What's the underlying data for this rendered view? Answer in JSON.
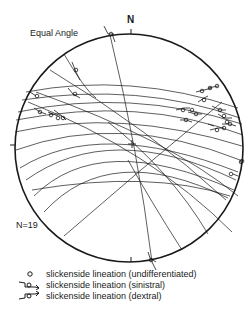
{
  "figure": {
    "title": "Equal Angle",
    "north_label": "N",
    "count_label": "N=19",
    "projection": "equal angle stereonet, lower hemisphere",
    "great_circle_count": 19
  },
  "legend": {
    "items": [
      {
        "symbol": "open-circle-icon",
        "label": "slickenside lineation (undifferentiated)"
      },
      {
        "symbol": "sinistral-arrow-icon",
        "label": "slickenside lineation (sinistral)"
      },
      {
        "symbol": "dextral-arrow-icon",
        "label": "slickenside lineation (dextral)"
      }
    ]
  },
  "colors": {
    "ink": "#1a1a1a",
    "background": "#ffffff"
  }
}
